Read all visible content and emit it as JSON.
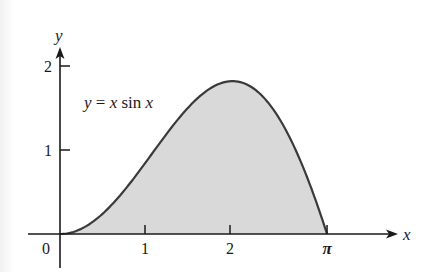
{
  "chart_data": {
    "type": "area",
    "title": "",
    "function_label": "y = x sin x",
    "xlabel": "x",
    "ylabel": "y",
    "origin_label": "0",
    "x_ticks": [
      {
        "value": 1,
        "label": "1"
      },
      {
        "value": 2,
        "label": "2"
      },
      {
        "value": 3.14159,
        "label": "π"
      }
    ],
    "y_ticks": [
      {
        "value": 1,
        "label": "1"
      },
      {
        "value": 2,
        "label": "2"
      }
    ],
    "xlim": [
      -0.38,
      3.98
    ],
    "ylim": [
      -0.2,
      2.2
    ],
    "grid": false,
    "legend": null,
    "shaded_region": {
      "from": 0,
      "to": 3.14159,
      "fill": "#d9d9d9"
    },
    "curve_color": "#3a3a3a",
    "x": [
      0,
      0.25,
      0.5,
      0.75,
      1.0,
      1.25,
      1.5,
      1.75,
      2.0,
      2.029,
      2.25,
      2.5,
      2.75,
      3.0,
      3.14159
    ],
    "values": [
      0,
      0.062,
      0.24,
      0.511,
      0.841,
      1.186,
      1.496,
      1.722,
      1.819,
      1.82,
      1.75,
      1.496,
      1.051,
      0.423,
      0
    ]
  }
}
